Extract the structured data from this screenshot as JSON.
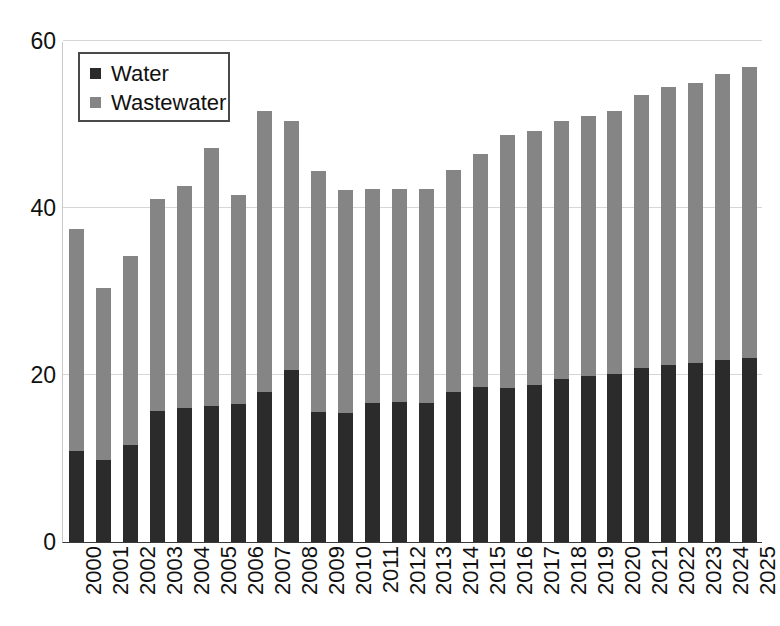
{
  "chart_data": {
    "type": "bar",
    "stacked": true,
    "title": "",
    "subtitle": "",
    "xlabel": "",
    "ylabel": "",
    "ylim": [
      0,
      60
    ],
    "yticks": [
      0,
      20,
      40,
      60
    ],
    "ytick_labels": [
      "0",
      "20",
      "40",
      "60"
    ],
    "grid": true,
    "grid_axis": "y",
    "legend_position": "top-left",
    "categories": [
      "2000",
      "2001",
      "2002",
      "2003",
      "2004",
      "2005",
      "2006",
      "2007",
      "2008",
      "2009",
      "2010",
      "2011",
      "2012",
      "2013",
      "2014",
      "2015",
      "2016",
      "2017",
      "2018",
      "2019",
      "2020",
      "2021",
      "2022",
      "2023",
      "2024",
      "2025"
    ],
    "series": [
      {
        "name": "Water",
        "color": "#2b2b2b",
        "values": [
          10.9,
          9.8,
          11.6,
          15.7,
          16.0,
          16.3,
          16.5,
          18.0,
          20.6,
          15.6,
          15.5,
          16.6,
          16.8,
          16.7,
          18.0,
          18.6,
          18.5,
          18.8,
          19.5,
          19.9,
          20.1,
          20.8,
          21.2,
          21.4,
          21.8,
          22.0
        ]
      },
      {
        "name": "Wastewater",
        "color": "#858585",
        "values": [
          26.6,
          20.6,
          22.6,
          25.4,
          26.6,
          30.9,
          25.0,
          33.6,
          29.8,
          28.8,
          26.7,
          25.7,
          25.5,
          25.6,
          26.5,
          27.9,
          30.3,
          30.4,
          30.9,
          31.1,
          31.5,
          32.7,
          33.3,
          33.6,
          34.2,
          34.9
        ]
      }
    ],
    "totals": [
      37.5,
      30.4,
      34.2,
      41.1,
      42.6,
      47.2,
      41.5,
      51.6,
      50.4,
      44.4,
      42.2,
      42.3,
      42.3,
      42.3,
      44.5,
      46.5,
      48.8,
      49.2,
      50.4,
      51.0,
      51.6,
      53.5,
      54.5,
      55.0,
      56.0,
      56.9
    ]
  },
  "legend": {
    "items": [
      {
        "label": "Water",
        "swatch": "water-swatch",
        "color": "#2b2b2b"
      },
      {
        "label": "Wastewater",
        "swatch": "wastewater-swatch",
        "color": "#858585"
      }
    ]
  }
}
